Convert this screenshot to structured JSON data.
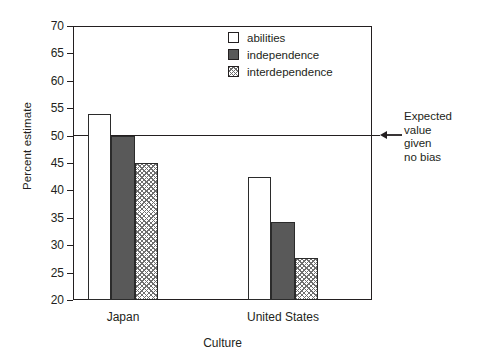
{
  "chart_data": {
    "type": "bar",
    "title": "",
    "xlabel": "Culture",
    "ylabel": "Percent estimate",
    "categories": [
      "Japan",
      "United States"
    ],
    "series": [
      {
        "name": "abilities",
        "values": [
          54.0,
          42.5
        ],
        "fill": "white"
      },
      {
        "name": "independence",
        "values": [
          50.0,
          34.3
        ],
        "fill": "gray"
      },
      {
        "name": "interdependence",
        "values": [
          45.0,
          27.7
        ],
        "fill": "hatch"
      }
    ],
    "ylim": [
      20,
      70
    ],
    "yticks": [
      70,
      65,
      60,
      55,
      50,
      45,
      40,
      35,
      30,
      25,
      20
    ],
    "grid": false,
    "legend_position": "top-center",
    "annotations": [
      {
        "name": "expected-value-line",
        "text": "Expected value given no bias",
        "text_lines": [
          "Expected",
          "value",
          "given",
          "no bias"
        ],
        "value": 50,
        "arrow": "left"
      }
    ],
    "colors": {
      "axis": "#231f20",
      "bar_outline": "#2b2b2b",
      "fill_white": "#ffffff",
      "fill_gray": "#595959",
      "fill_hatch_line": "#6e6e6e",
      "background": "#ffffff"
    }
  }
}
